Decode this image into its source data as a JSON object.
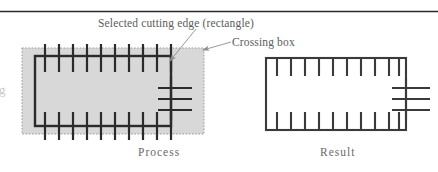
{
  "figure": {
    "kind": "technical-illustration",
    "title": "",
    "background_color": "#ffffff",
    "top_rule": {
      "color": "#2b2b2b",
      "y": 11,
      "x1": 0,
      "x2": 438,
      "thickness": 1.4
    },
    "left_margin_artifact": "g"
  },
  "annotations": {
    "selected_cutting_edge": "Selected cutting edge (rectangle)",
    "crossing_box": "Crossing box"
  },
  "panels": [
    {
      "id": "process",
      "caption": "Process",
      "crossing_box": {
        "x": 22,
        "y": 48,
        "width": 182,
        "height": 86,
        "fill": "#d8d8d8",
        "stroke": "#9b9b9b",
        "stroke_style": "dotted",
        "stroke_width": 1
      },
      "rectangle": {
        "x": 35,
        "y": 56,
        "width": 136,
        "height": 70,
        "stroke": "#2b2b2b",
        "stroke_width": 2.2,
        "fill": "none"
      },
      "top_ticks": {
        "count": 10,
        "x_start": 45,
        "x_step": 14,
        "y_top": 44,
        "y_bottom": 72,
        "stroke": "#2b2b2b",
        "stroke_width": 2.2
      },
      "bottom_ticks": {
        "count": 10,
        "x_start": 45,
        "x_step": 14,
        "y_top": 112,
        "y_bottom": 140,
        "stroke": "#2b2b2b",
        "stroke_width": 2.2
      },
      "right_cross_lines": {
        "count": 3,
        "x_left": 158,
        "x_right": 192,
        "y_start": 88,
        "y_step": 11,
        "stroke": "#2b2b2b",
        "stroke_width": 2.2
      }
    },
    {
      "id": "result",
      "caption": "Result",
      "rectangle": {
        "x": 266,
        "y": 58,
        "width": 140,
        "height": 72,
        "stroke": "#3a3a3a",
        "stroke_width": 2.0,
        "fill": "none"
      },
      "top_ticks": {
        "count": 10,
        "x_start": 277,
        "x_step": 14,
        "y_top": 58,
        "y_bottom": 76,
        "stroke": "#3a3a3a",
        "stroke_width": 2.0
      },
      "bottom_ticks": {
        "count": 10,
        "x_start": 277,
        "x_step": 14,
        "y_top": 112,
        "y_bottom": 130,
        "stroke": "#3a3a3a",
        "stroke_width": 2.0
      },
      "right_cross_lines": {
        "count": 3,
        "x_left": 392,
        "x_right": 428,
        "y_start": 88,
        "y_step": 11,
        "stroke": "#3a3a3a",
        "stroke_width": 2.0
      }
    }
  ],
  "leaders": [
    {
      "name": "selected-edge-leader",
      "from_x": 195,
      "from_y": 30,
      "to_x": 168,
      "to_y": 62,
      "stroke": "#8d8d8d",
      "arrow": true
    },
    {
      "name": "crossing-box-leader",
      "from_x": 230,
      "from_y": 42,
      "to_x": 202,
      "to_y": 50,
      "stroke": "#8d8d8d",
      "arrow": true
    }
  ],
  "colors": {
    "ink": "#2b2b2b",
    "ink_soft": "#3a3a3a",
    "text": "#5b5b5b",
    "caption": "#6a6a6a",
    "box_fill": "#d8d8d8",
    "box_stroke": "#9b9b9b",
    "leader": "#8d8d8d",
    "page": "#ffffff"
  }
}
